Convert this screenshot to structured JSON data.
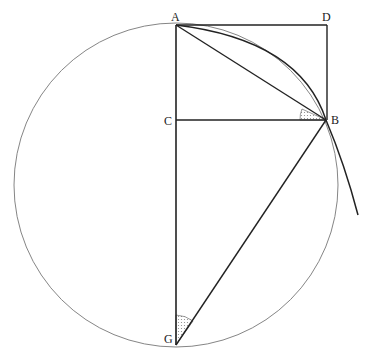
{
  "diagram": {
    "points": {
      "A": {
        "label": "A",
        "x": 176,
        "y": 25
      },
      "D": {
        "label": "D",
        "x": 327,
        "y": 25
      },
      "C": {
        "label": "C",
        "x": 176,
        "y": 120
      },
      "B": {
        "label": "B",
        "x": 326,
        "y": 120
      },
      "G": {
        "label": "G",
        "x": 176,
        "y": 345
      }
    },
    "circle": {
      "cx": 176,
      "cy": 185,
      "r": 160
    },
    "colors": {
      "stroke": "#222222",
      "thin": "#666666",
      "hatch": "#999999"
    }
  }
}
